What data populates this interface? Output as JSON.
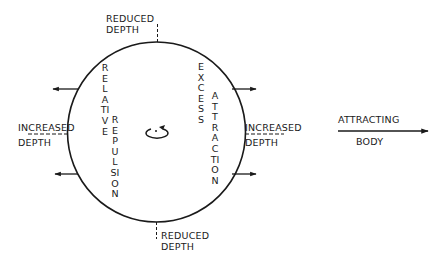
{
  "diagram": {
    "labels": {
      "top_reduced_depth": [
        "REDUCED",
        "DEPTH"
      ],
      "bottom_reduced_depth": [
        "REDUCED",
        "DEPTH"
      ],
      "left_increased_depth": [
        "INCREASED",
        "DEPTH"
      ],
      "right_increased_depth": [
        "INCREASED",
        "DEPTH"
      ],
      "attracting_body": [
        "ATTRACTING",
        "BODY"
      ]
    },
    "vertical_text": {
      "relative": "RELATIVE",
      "repulsion": "REPULSION",
      "excess": "EXCESS",
      "attraction": "ATTRACTION"
    },
    "arrows": {
      "left_side": "outward-left",
      "right_side": "outward-right",
      "attracting_body_direction": "right"
    },
    "colors": {
      "ink": "#1a1a1a",
      "background": "#ffffff"
    }
  }
}
